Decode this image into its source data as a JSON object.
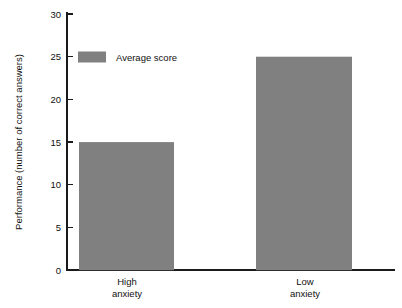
{
  "chart_data": {
    "type": "bar",
    "title": "",
    "subtitle": "",
    "xlabel": "",
    "ylabel": "Performance (number of correct answers)",
    "categories": [
      "High anxiety",
      "Low anxiety"
    ],
    "category_lines": [
      [
        "High",
        "anxiety"
      ],
      [
        "Low",
        "anxiety"
      ]
    ],
    "values": [
      15,
      25
    ],
    "series": [
      {
        "name": "Average score",
        "values": [
          15,
          25
        ],
        "color": "#808080"
      }
    ],
    "ylim": [
      0,
      30
    ],
    "ytick_step": 5,
    "yticks": [
      0,
      5,
      10,
      15,
      20,
      25,
      30
    ],
    "ytick_labels": [
      "0",
      "5",
      "10",
      "15",
      "20",
      "25",
      "30"
    ],
    "grid": false,
    "legend": {
      "position": "inside-top-left",
      "entries": [
        {
          "label": "Average score",
          "color": "#808080"
        }
      ]
    },
    "axis_color": "#1a1a1a",
    "background_color": "#ffffff"
  }
}
